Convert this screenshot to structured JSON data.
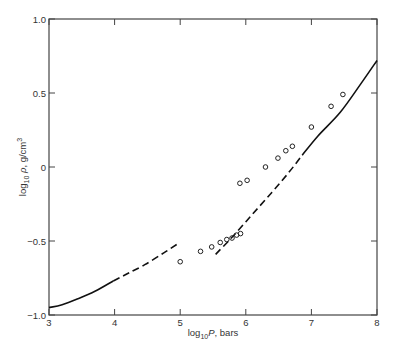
{
  "chart_data": {
    "type": "line",
    "title": "",
    "xlabel": {
      "prefix": "log",
      "sub": "10",
      "main": "P",
      "suffix": ", bars"
    },
    "ylabel": {
      "prefix": "log",
      "sub": "10",
      "main": " ρ",
      "suffix": ", g/cm",
      "sup": "3"
    },
    "xlim": [
      3,
      8
    ],
    "ylim": [
      -1.0,
      1.0
    ],
    "xticks": [
      3,
      4,
      5,
      6,
      7,
      8
    ],
    "xtick_labels": [
      "3",
      "4",
      "5",
      "6",
      "7",
      "8"
    ],
    "yticks": [
      -1.0,
      -0.5,
      0,
      0.5,
      1.0
    ],
    "ytick_labels": [
      "−1.0",
      "−0.5",
      "0",
      "0.5",
      "1.0"
    ],
    "grid": false,
    "legend": "none",
    "series": [
      {
        "name": "theory-low-pressure",
        "style": "solid",
        "x": [
          3.0,
          3.2,
          3.44,
          3.7,
          3.98
        ],
        "y": [
          -0.95,
          -0.93,
          -0.89,
          -0.84,
          -0.77
        ]
      },
      {
        "name": "theory-low-pressure-extrapolated",
        "style": "dashed",
        "x": [
          3.98,
          4.2,
          4.46,
          4.75,
          4.96
        ],
        "y": [
          -0.77,
          -0.72,
          -0.66,
          -0.58,
          -0.52
        ]
      },
      {
        "name": "theory-high-pressure-extrapolated",
        "style": "dashed",
        "x": [
          5.54,
          5.8,
          6.1,
          6.4,
          6.65,
          6.86
        ],
        "y": [
          -0.59,
          -0.47,
          -0.32,
          -0.17,
          -0.04,
          0.08
        ]
      },
      {
        "name": "theory-high-pressure",
        "style": "solid",
        "x": [
          6.86,
          7.1,
          7.44,
          7.75,
          8.0
        ],
        "y": [
          0.08,
          0.21,
          0.37,
          0.56,
          0.72
        ]
      },
      {
        "name": "experimental-points",
        "style": "markers",
        "marker": "open-circle",
        "x": [
          5.0,
          5.31,
          5.48,
          5.61,
          5.71,
          5.79,
          5.86,
          5.92,
          5.91,
          6.02,
          6.3,
          6.49,
          6.61,
          6.71,
          7.0,
          7.3,
          7.48
        ],
        "y": [
          -0.64,
          -0.57,
          -0.54,
          -0.51,
          -0.49,
          -0.48,
          -0.46,
          -0.45,
          -0.11,
          -0.09,
          0.0,
          0.06,
          0.11,
          0.14,
          0.27,
          0.41,
          0.49
        ]
      }
    ]
  }
}
